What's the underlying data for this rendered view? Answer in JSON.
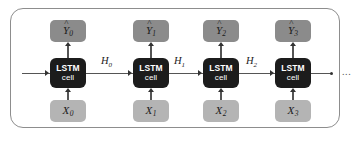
{
  "diagram": {
    "colors": {
      "frame_border": "#8d8d8d",
      "output_box": "#8b8b8b",
      "input_box": "#b4b4b4",
      "cell_box": "#1c1c1c",
      "cell_text": "#ffffff",
      "connector": "#555555",
      "label_text": "#1a1a1a",
      "background": "#ffffff"
    },
    "cell": {
      "line1": "LSTM",
      "line2": "cell"
    },
    "timesteps": [
      {
        "index": 0,
        "output": {
          "hat": "^",
          "base": "Y",
          "sub": "0"
        },
        "input": {
          "base": "X",
          "sub": "0"
        },
        "cell_line1": "LSTM",
        "cell_line2": "cell"
      },
      {
        "index": 1,
        "output": {
          "hat": "^",
          "base": "Y",
          "sub": "1"
        },
        "input": {
          "base": "X",
          "sub": "1"
        },
        "cell_line1": "LSTM",
        "cell_line2": "cell"
      },
      {
        "index": 2,
        "output": {
          "hat": "^",
          "base": "Y",
          "sub": "2"
        },
        "input": {
          "base": "X",
          "sub": "2"
        },
        "cell_line1": "LSTM",
        "cell_line2": "cell"
      },
      {
        "index": 3,
        "output": {
          "hat": "^",
          "base": "Y",
          "sub": "3"
        },
        "input": {
          "base": "X",
          "sub": "3"
        },
        "cell_line1": "LSTM",
        "cell_line2": "cell"
      }
    ],
    "hidden_states": [
      {
        "base": "H",
        "sub": "0"
      },
      {
        "base": "H",
        "sub": "1"
      },
      {
        "base": "H",
        "sub": "2"
      }
    ],
    "continuation": "..."
  }
}
